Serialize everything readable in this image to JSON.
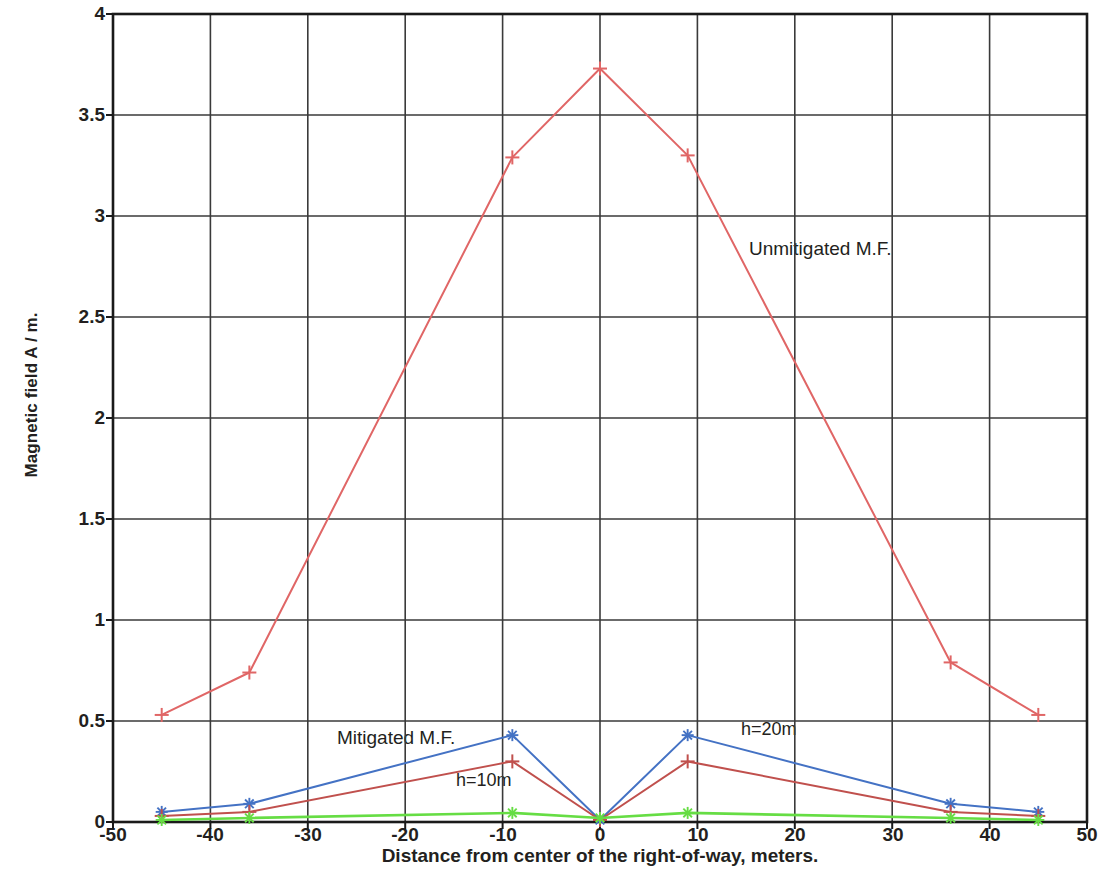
{
  "axes": {
    "ylabel": "Magnetic field A / m.",
    "xlabel": "Distance from center of the right-of-way, meters.",
    "xticks": [
      "-50",
      "-40",
      "-30",
      "-20",
      "-10",
      "0",
      "10",
      "20",
      "30",
      "40",
      "50"
    ],
    "yticks": [
      "0",
      "0.5",
      "1",
      "1.5",
      "2",
      "2.5",
      "3",
      "3.5",
      "4"
    ]
  },
  "annotations": {
    "unmitigated": "Unmitigated M.F.",
    "mitigated": "Mitigated M.F.",
    "h10": "h=10m",
    "h20": "h=20m"
  },
  "colors": {
    "unmitigated": "#e06666",
    "h10": "#c0504d",
    "h20": "#4472c4",
    "flat": "#66dd44",
    "grid": "#3a3a3a",
    "text": "#231f20"
  },
  "chart_data": {
    "type": "line",
    "title": "",
    "xlabel": "Distance from center of the right-of-way, meters.",
    "ylabel": "Magnetic field A / m.",
    "xlim": [
      -50,
      50
    ],
    "ylim": [
      0,
      4
    ],
    "xticks": [
      -50,
      -40,
      -30,
      -20,
      -10,
      0,
      10,
      20,
      30,
      40,
      50
    ],
    "yticks": [
      0,
      0.5,
      1,
      1.5,
      2,
      2.5,
      3,
      3.5,
      4
    ],
    "grid": true,
    "legend": "annotations-in-plot",
    "series": [
      {
        "name": "Unmitigated M.F.",
        "color": "#e06666",
        "marker": "plus",
        "x": [
          -45,
          -36,
          -9,
          0,
          9,
          36,
          45
        ],
        "y": [
          0.53,
          0.74,
          3.29,
          3.73,
          3.3,
          0.79,
          0.53
        ]
      },
      {
        "name": "Mitigated M.F. h=20m",
        "color": "#4472c4",
        "marker": "asterisk",
        "x": [
          -45,
          -36,
          -9,
          0,
          9,
          36,
          45
        ],
        "y": [
          0.05,
          0.09,
          0.43,
          0.01,
          0.43,
          0.09,
          0.05
        ]
      },
      {
        "name": "Mitigated M.F. h=10m",
        "color": "#c0504d",
        "marker": "plus",
        "x": [
          -45,
          -36,
          -9,
          0,
          9,
          36,
          45
        ],
        "y": [
          0.03,
          0.05,
          0.3,
          0.01,
          0.3,
          0.05,
          0.03
        ]
      },
      {
        "name": "Flat baseline",
        "color": "#66dd44",
        "marker": "asterisk",
        "x": [
          -45,
          -36,
          -9,
          0,
          9,
          36,
          45
        ],
        "y": [
          0.01,
          0.02,
          0.045,
          0.02,
          0.045,
          0.02,
          0.01
        ]
      }
    ]
  }
}
